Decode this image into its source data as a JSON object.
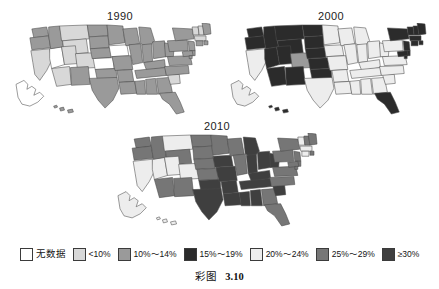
{
  "figure": {
    "caption_label": "彩图",
    "caption_number": "3.10"
  },
  "panels": [
    {
      "id": "1990",
      "title": "1990"
    },
    {
      "id": "2000",
      "title": "2000"
    },
    {
      "id": "2010",
      "title": "2010"
    }
  ],
  "legend": {
    "items": [
      {
        "label": "无数据",
        "color": "#ffffff",
        "cjk": true
      },
      {
        "label": "<10%",
        "color": "#d8d8d8",
        "cjk": false
      },
      {
        "label": "10%～14%",
        "color": "#9a9a9a",
        "cjk": false
      },
      {
        "label": "15%～19%",
        "color": "#2b2b2b",
        "cjk": false
      },
      {
        "label": "20%～24%",
        "color": "#ededed",
        "cjk": false
      },
      {
        "label": "25%～29%",
        "color": "#767676",
        "cjk": false
      },
      {
        "label": "≥30%",
        "color": "#3f3f3f",
        "cjk": false
      }
    ]
  },
  "chart_data": {
    "type": "heatmap",
    "subtitle": "",
    "xlabel": "",
    "ylabel": "",
    "legend_position": "bottom",
    "grid": false,
    "categories": [
      "无数据",
      "<10%",
      "10%～14%",
      "15%～19%",
      "20%～24%",
      "25%～29%",
      "≥30%"
    ],
    "category_colors": [
      "#ffffff",
      "#d8d8d8",
      "#9a9a9a",
      "#2b2b2b",
      "#ededed",
      "#767676",
      "#3f3f3f"
    ],
    "panels": [
      "1990",
      "2000",
      "2010"
    ],
    "series": [
      {
        "name": "1990",
        "values": {
          "WA": "10%～14%",
          "OR": "10%～14%",
          "CA": "<10%",
          "NV": "无数据",
          "ID": "10%～14%",
          "MT": "<10%",
          "WY": "<10%",
          "UT": "<10%",
          "AZ": "<10%",
          "CO": "<10%",
          "NM": "10%～14%",
          "ND": "10%～14%",
          "SD": "10%～14%",
          "NE": "10%～14%",
          "KS": "无数据",
          "OK": "10%～14%",
          "TX": "10%～14%",
          "MN": "10%～14%",
          "IA": "无数据",
          "MO": "10%～14%",
          "AR": "10%～14%",
          "LA": "10%～14%",
          "WI": "10%～14%",
          "IL": "10%～14%",
          "MS": "10%～14%",
          "MI": "10%～14%",
          "IN": "10%～14%",
          "KY": "10%～14%",
          "TN": "10%～14%",
          "AL": "10%～14%",
          "OH": "10%～14%",
          "WV": "10%～14%",
          "GA": "10%～14%",
          "FL": "10%～14%",
          "SC": "<10%",
          "NC": "10%～14%",
          "VA": "10%～14%",
          "PA": "10%～14%",
          "NY": "10%～14%",
          "VT": "<10%",
          "NH": "<10%",
          "ME": "10%～14%",
          "MA": "<10%",
          "RI": "10%～14%",
          "CT": "10%～14%",
          "NJ": "10%～14%",
          "DE": "10%～14%",
          "MD": "10%～14%",
          "DC": "10%～14%",
          "AK": "无数据",
          "HI": "10%～14%"
        }
      },
      {
        "name": "2000",
        "values": {
          "WA": "15%～19%",
          "OR": "15%～19%",
          "CA": "20%～24%",
          "NV": "15%～19%",
          "ID": "15%～19%",
          "MT": "15%～19%",
          "WY": "15%～19%",
          "UT": "15%～19%",
          "AZ": "15%～19%",
          "CO": "10%～14%",
          "NM": "15%～19%",
          "ND": "15%～19%",
          "SD": "15%～19%",
          "NE": "15%～19%",
          "KS": "15%～19%",
          "OK": "15%～19%",
          "TX": "20%～24%",
          "MN": "20%～24%",
          "IA": "20%～24%",
          "MO": "20%～24%",
          "AR": "20%～24%",
          "LA": "20%～24%",
          "WI": "20%～24%",
          "IL": "20%～24%",
          "MS": "20%～24%",
          "MI": "20%～24%",
          "IN": "20%～24%",
          "KY": "20%～24%",
          "TN": "20%～24%",
          "AL": "20%～24%",
          "OH": "20%～24%",
          "WV": "20%～24%",
          "GA": "20%～24%",
          "FL": "15%～19%",
          "SC": "20%～24%",
          "NC": "20%～24%",
          "VA": "20%～24%",
          "PA": "20%～24%",
          "NY": "15%～19%",
          "VT": "15%～19%",
          "NH": "15%～19%",
          "ME": "15%～19%",
          "MA": "15%～19%",
          "RI": "15%～19%",
          "CT": "15%～19%",
          "NJ": "15%～19%",
          "DE": "15%～19%",
          "MD": "15%～19%",
          "DC": "15%～19%",
          "AK": "20%～24%",
          "HI": "15%～19%"
        }
      },
      {
        "name": "2010",
        "values": {
          "WA": "25%～29%",
          "OR": "25%～29%",
          "CA": "20%～24%",
          "NV": "20%～24%",
          "ID": "25%～29%",
          "MT": "20%～24%",
          "WY": "25%～29%",
          "UT": "20%～24%",
          "AZ": "25%～29%",
          "CO": "20%～24%",
          "NM": "25%～29%",
          "ND": "25%～29%",
          "SD": "25%～29%",
          "NE": "25%～29%",
          "KS": "25%～29%",
          "OK": "≥30%",
          "TX": "≥30%",
          "MN": "25%～29%",
          "IA": "≥30%",
          "MO": "≥30%",
          "AR": "≥30%",
          "LA": "≥30%",
          "WI": "25%～29%",
          "IL": "25%～29%",
          "MS": "≥30%",
          "MI": "≥30%",
          "IN": "≥30%",
          "KY": "≥30%",
          "TN": "≥30%",
          "AL": "≥30%",
          "OH": "≥30%",
          "WV": "≥30%",
          "GA": "25%～29%",
          "FL": "25%～29%",
          "SC": "≥30%",
          "NC": "25%～29%",
          "VA": "25%～29%",
          "PA": "25%～29%",
          "NY": "25%～29%",
          "VT": "20%～24%",
          "NH": "25%～29%",
          "ME": "25%～29%",
          "MA": "20%～24%",
          "RI": "25%～29%",
          "CT": "20%～24%",
          "NJ": "25%～29%",
          "DE": "25%～29%",
          "MD": "25%～29%",
          "DC": "25%～29%",
          "AK": "20%～24%",
          "HI": "20%～24%"
        }
      }
    ]
  }
}
